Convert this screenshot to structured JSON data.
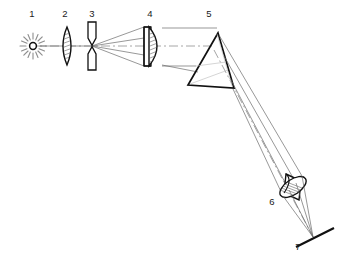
{
  "diagram": {
    "background_color": "#ffffff",
    "stroke_color": "#1a1a1a",
    "ray_color": "#555555",
    "axis_color": "#9a9a9a",
    "width": 347,
    "height": 255,
    "labels": [
      {
        "id": "1",
        "text": "1",
        "x": 32,
        "y": 17,
        "component": "light-source"
      },
      {
        "id": "2",
        "text": "2",
        "x": 65,
        "y": 17,
        "component": "condenser-lens"
      },
      {
        "id": "3",
        "text": "3",
        "x": 92,
        "y": 17,
        "component": "entrance-slit"
      },
      {
        "id": "4",
        "text": "4",
        "x": 150,
        "y": 17,
        "component": "collimating-lens"
      },
      {
        "id": "5",
        "text": "5",
        "x": 209,
        "y": 17,
        "component": "dispersing-prism"
      },
      {
        "id": "6",
        "text": "6",
        "x": 272,
        "y": 205,
        "component": "focusing-lens"
      },
      {
        "id": "7",
        "text": "7",
        "x": 298,
        "y": 250,
        "component": "detector-screen"
      }
    ],
    "components": [
      {
        "ref": "1",
        "name": "light-source",
        "kind": "radiant-point-source",
        "cx": 33,
        "cy": 46
      },
      {
        "ref": "2",
        "name": "condenser-lens",
        "kind": "biconvex-lens",
        "cx": 67,
        "cy": 46
      },
      {
        "ref": "3",
        "name": "entrance-slit",
        "kind": "adjustable-slit",
        "cx": 92,
        "cy": 46
      },
      {
        "ref": "4",
        "name": "collimating-lens",
        "kind": "mounted-plano-convex-lens",
        "cx": 153,
        "cy": 46
      },
      {
        "ref": "5",
        "name": "dispersing-prism",
        "kind": "triangular-prism",
        "cx": 213,
        "cy": 63
      },
      {
        "ref": "6",
        "name": "focusing-lens",
        "kind": "tilted-barrel-lens",
        "cx": 292,
        "cy": 188
      },
      {
        "ref": "7",
        "name": "detector-screen",
        "kind": "flat-screen",
        "cx": 313,
        "cy": 238
      }
    ]
  }
}
